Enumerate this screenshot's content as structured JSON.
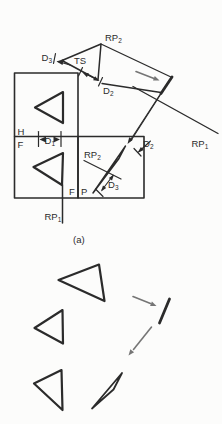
{
  "figure": {
    "caption": {
      "text": "(a)"
    },
    "labels": {
      "rp2_top": {
        "base": "RP",
        "sub": "2"
      },
      "d3_top": {
        "base": "D",
        "sub": "3"
      },
      "ts": {
        "base": "TS",
        "sub": ""
      },
      "d2_top": {
        "base": "D",
        "sub": "2"
      },
      "rp1_right": {
        "base": "RP",
        "sub": "1"
      },
      "h": {
        "base": "H",
        "sub": ""
      },
      "f_left": {
        "base": "F",
        "sub": ""
      },
      "d1": {
        "base": "D",
        "sub": "1"
      },
      "rp2_inner": {
        "base": "RP",
        "sub": "2"
      },
      "d2_inner": {
        "base": "D",
        "sub": "2"
      },
      "d3_inner": {
        "base": "D",
        "sub": "3"
      },
      "f_inner": {
        "base": "F",
        "sub": ""
      },
      "p_inner": {
        "base": "P",
        "sub": ""
      },
      "rp1_bottom": {
        "base": "RP",
        "sub": "1"
      }
    },
    "colors": {
      "ink": "#2b2b2b",
      "arrow": "#757575",
      "background": "#fcfcfb"
    }
  }
}
